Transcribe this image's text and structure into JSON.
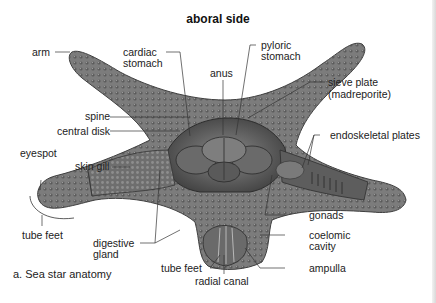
{
  "figure": {
    "title": "aboral side",
    "caption": "a. Sea star anatomy",
    "colors": {
      "body": "#7a7a7a",
      "body_dark": "#4e4e4e",
      "body_light": "#a6a6a6",
      "interior": "#5f5f5f",
      "leader_line": "#333333",
      "background": "#ffffff"
    }
  },
  "labels": {
    "arm": "arm",
    "cardiac_stomach_1": "cardiac",
    "cardiac_stomach_2": "stomach",
    "anus": "anus",
    "pyloric_stomach_1": "pyloric",
    "pyloric_stomach_2": "stomach",
    "sieve_plate_1": "sieve plate",
    "sieve_plate_2": "(madreporite)",
    "spine": "spine",
    "central_disk": "central disk",
    "endoskeletal_plates": "endoskeletal plates",
    "eyespot": "eyespot",
    "skin_gill": "skin gill",
    "tube_feet_left": "tube feet",
    "digestive_gland_1": "digestive",
    "digestive_gland_2": "gland",
    "gonads": "gonads",
    "coelomic_cavity_1": "coelomic",
    "coelomic_cavity_2": "cavity",
    "tube_feet_bottom": "tube feet",
    "radial_canal": "radial canal",
    "ampulla": "ampulla"
  }
}
